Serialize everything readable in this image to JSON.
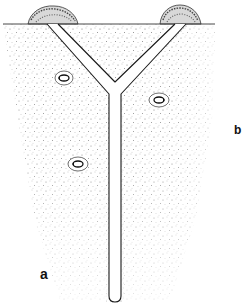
{
  "figure": {
    "labels": {
      "a": "a",
      "b": "b"
    },
    "colors": {
      "background": "#ffffff",
      "ink": "#1a1a1a",
      "stipple": "#7a7a7a"
    },
    "surface_line": {
      "x1": 3,
      "x2": 215,
      "y": 24
    },
    "mounds": [
      {
        "name": "left-mound",
        "cx": 52,
        "cy": 24,
        "rx": 26,
        "ry": 14
      },
      {
        "name": "right-mound",
        "cx": 180,
        "cy": 24,
        "rx": 22,
        "ry": 14
      }
    ],
    "tunnel": {
      "left_entry": [
        47,
        58
      ],
      "right_entry": [
        175,
        186
      ],
      "junction": {
        "x": 115,
        "y": 90
      },
      "shaft": {
        "x_left": 109,
        "x_right": 121,
        "bottom_y": 302
      }
    },
    "cocoons": [
      {
        "name": "cocoon-1",
        "cx": 64,
        "cy": 78,
        "rx": 9,
        "ry": 7
      },
      {
        "name": "cocoon-2",
        "cx": 159,
        "cy": 100,
        "rx": 10,
        "ry": 7
      },
      {
        "name": "cocoon-3",
        "cx": 78,
        "cy": 164,
        "rx": 10,
        "ry": 7
      }
    ]
  }
}
